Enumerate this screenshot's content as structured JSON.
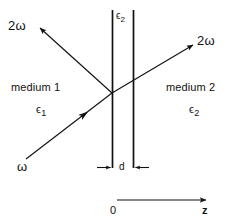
{
  "figure": {
    "background_color": "#ffffff",
    "ink_color": "#111111"
  },
  "labels": {
    "reflected_harmonic": "2ω",
    "transmitted_harmonic": "2ω",
    "incident_fundamental": "ω",
    "slab_permittivity_base": "ϵ",
    "slab_permittivity_sub": "2",
    "medium1_name": "medium 1",
    "medium1_eps_base": "ϵ",
    "medium1_eps_sub": "1",
    "medium2_name": "medium 2",
    "medium2_eps_base": "ϵ",
    "medium2_eps_sub": "2",
    "thickness": "d",
    "origin": "0",
    "axis": "z"
  },
  "geometry": {
    "slab_left_x": 112,
    "slab_right_x": 133,
    "slab_top_y": 10,
    "slab_bottom_y": 168,
    "intersection_x": 112,
    "intersection_y": 93,
    "incident_start_x": 26,
    "incident_start_y": 159,
    "reflected_tip_x": 37,
    "reflected_tip_y": 26,
    "transmitted_tip_x": 196,
    "transmitted_tip_y": 43,
    "axis_start_x": 117,
    "axis_end_x": 208,
    "axis_y": 200
  }
}
